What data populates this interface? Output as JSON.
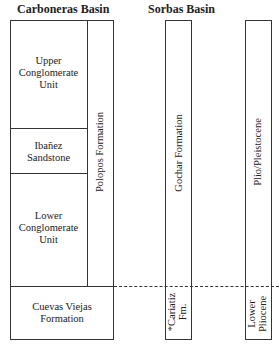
{
  "headers": {
    "carboneras": "Carboneras Basin",
    "sorbas": "Sorbas Basin"
  },
  "carboneras": {
    "units": [
      {
        "name": "Upper Conglomerate Unit",
        "lines": [
          "Upper",
          "Conglomerate",
          "Unit"
        ]
      },
      {
        "name": "Ibañez Sandstone",
        "lines": [
          "Ibañez",
          "Sandstone"
        ]
      },
      {
        "name": "Lower Conglomerate Unit",
        "lines": [
          "Lower",
          "Conglomerate",
          "Unit"
        ]
      },
      {
        "name": "Cuevas Viejas Formation",
        "lines": [
          "Cuevas Viejas",
          "Formation"
        ]
      }
    ],
    "side_column": "Polopos Formation"
  },
  "sorbas": {
    "upper": "Gochar Formation",
    "lower_lines": [
      "*Cariatiz",
      "Fm."
    ]
  },
  "age": {
    "upper": "Plio/Pleistocene",
    "lower_lines": [
      "Lower",
      "Pliocene"
    ]
  },
  "colors": {
    "line": "#333333",
    "text": "#222222",
    "background": "#ffffff"
  }
}
